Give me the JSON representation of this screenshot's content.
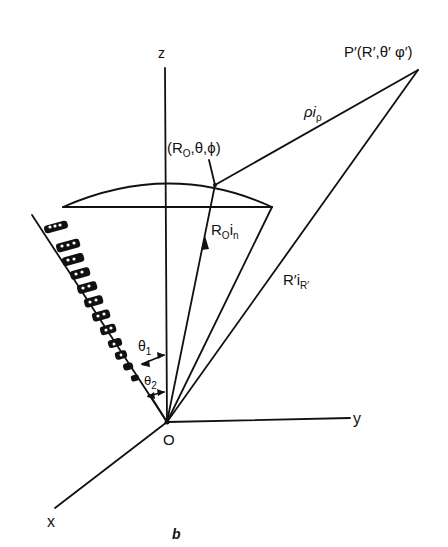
{
  "figure": {
    "caption": "b",
    "axes": {
      "x_label": "x",
      "y_label": "y",
      "z_label": "z",
      "origin_label": "O"
    },
    "points": {
      "observation_point": "P′(R′,θ′ φ′)",
      "surface_point": "(R",
      "surface_point_sub": "O",
      "surface_point_rest": ",θ,ϕ)"
    },
    "vectors": {
      "rho": "ρi",
      "rho_sub": "ρ",
      "r0_main": "R",
      "r0_sub": "O",
      "r0_tail": "i",
      "r0_tail_sub": "n",
      "rprime_main": "R′i",
      "rprime_sub": "R′"
    },
    "angles": {
      "theta1": "θ",
      "theta1_sub": "1",
      "theta2": "θ",
      "theta2_sub": "2"
    },
    "colors": {
      "ink": "#111111",
      "background": "#ffffff"
    }
  }
}
